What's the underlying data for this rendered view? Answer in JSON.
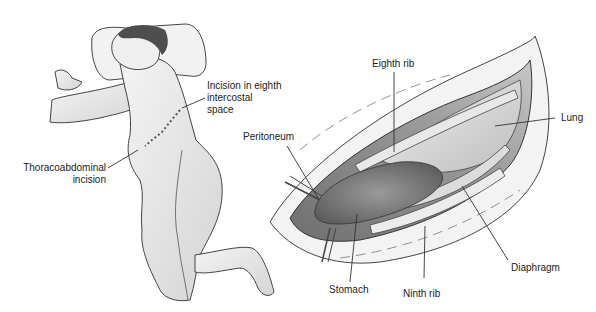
{
  "figure": {
    "type": "medical-illustration",
    "panels": [
      {
        "id": "patient-position",
        "description": "Patient positioned semi-lateral showing thoracoabdominal incision line"
      },
      {
        "id": "operative-view",
        "description": "Exposed thoracoabdominal field through eighth intercostal space"
      }
    ]
  },
  "labels": {
    "incision_eighth": "Incision in eighth\nintercostal\nspace",
    "thoracoabdominal": "Thoracoabdominal\nincision",
    "peritoneum": "Peritoneum",
    "eighth_rib": "Eighth rib",
    "lung": "Lung",
    "diaphragm": "Diaphragm",
    "stomach": "Stomach",
    "ninth_rib": "Ninth rib"
  },
  "colors": {
    "line": "#333333",
    "skin": "#ededed",
    "skin_shadow": "#c8c8c8",
    "hair": "#555555",
    "organ_dark": "#7a7a7a",
    "organ_mid": "#a8a8a8",
    "organ_light": "#d6d6d6"
  }
}
